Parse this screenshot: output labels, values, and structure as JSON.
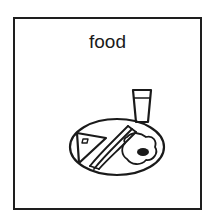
{
  "card": {
    "label": "food",
    "illustration": "breakfast-plate-icon",
    "items": [
      "sandwich-icon",
      "bacon-icon",
      "fried-egg-icon",
      "glass-icon",
      "plate-icon"
    ],
    "colors": {
      "stroke": "#1a1a1a",
      "background": "#ffffff",
      "border": "#1e1e1e"
    }
  }
}
